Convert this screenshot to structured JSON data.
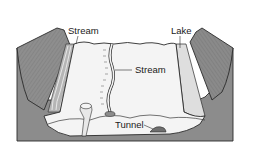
{
  "diagram": {
    "labels": {
      "stream_left": "Stream",
      "lake": "Lake",
      "stream_center": "Stream",
      "tunnel": "Tunnel"
    },
    "colors": {
      "valley_wall": "#8a8a8a",
      "valley_wall_dark": "#6e6e6e",
      "valley_floor": "#f4f4f4",
      "lake": "#dedede",
      "base": "#8c8c8c",
      "outline": "#2a2a2a"
    }
  }
}
